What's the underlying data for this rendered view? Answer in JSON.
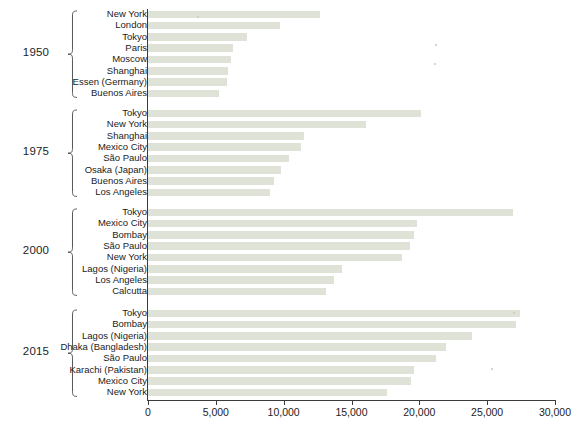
{
  "chart_data": {
    "type": "bar",
    "orientation": "horizontal",
    "title": "",
    "xlabel": "",
    "ylabel": "",
    "xlim": [
      0,
      30000
    ],
    "grid": false,
    "legend": null,
    "xticks": [
      "0",
      "5,000",
      "10,000",
      "15,000",
      "20,000",
      "25,000",
      "30,000"
    ],
    "xtick_values": [
      0,
      5000,
      10000,
      15000,
      20000,
      25000,
      30000
    ],
    "bar_color": "#dfe2d6",
    "axis_color": "#3b3b3b",
    "groups": [
      {
        "year": "1950",
        "categories": [
          "New York",
          "London",
          "Tokyo",
          "Paris",
          "Moscow",
          "Shanghai",
          "Essen (Germany)",
          "Buenos Aires"
        ],
        "values": [
          12700,
          9700,
          7300,
          6300,
          6100,
          5900,
          5800,
          5200
        ]
      },
      {
        "year": "1975",
        "categories": [
          "Tokyo",
          "New York",
          "Shanghai",
          "Mexico City",
          "São Paulo",
          "Osaka (Japan)",
          "Buenos Aires",
          "Los Angeles"
        ],
        "values": [
          20100,
          16100,
          11500,
          11300,
          10400,
          9800,
          9300,
          9000
        ]
      },
      {
        "year": "2000",
        "categories": [
          "Tokyo",
          "Mexico City",
          "Bombay",
          "São Paulo",
          "New York",
          "Lagos (Nigeria)",
          "Los Angeles",
          "Calcutta"
        ],
        "values": [
          26900,
          19800,
          19600,
          19300,
          18700,
          14300,
          13700,
          13100
        ]
      },
      {
        "year": "2015",
        "categories": [
          "Tokyo",
          "Bombay",
          "Lagos (Nigeria)",
          "Dhaka (Bangladesh)",
          "São Paulo",
          "Karachi (Pakistan)",
          "Mexico City",
          "New York"
        ],
        "values": [
          27400,
          27100,
          23900,
          22000,
          21200,
          19600,
          19400,
          17600
        ]
      }
    ]
  }
}
